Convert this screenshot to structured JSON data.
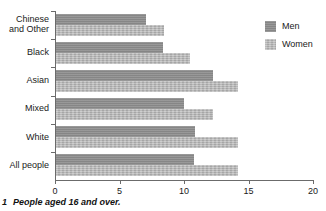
{
  "chart_data": {
    "type": "bar",
    "orientation": "horizontal",
    "title": "",
    "xlabel": "",
    "ylabel": "",
    "xlim": [
      0,
      20
    ],
    "xticks": [
      0,
      5,
      10,
      15,
      20
    ],
    "xtick_labels": [
      "0",
      "5",
      "10",
      "15",
      "20"
    ],
    "grid": false,
    "legend_position": "top-right",
    "categories": [
      "Chinese\nand Other",
      "Black",
      "Asian",
      "Mixed",
      "White",
      "All people"
    ],
    "series": [
      {
        "name": "Men",
        "color": "#8d8d8d",
        "values": [
          7.0,
          8.3,
          12.2,
          9.9,
          10.8,
          10.7
        ]
      },
      {
        "name": "Women",
        "color": "#b2b2b2",
        "values": [
          8.4,
          10.4,
          14.1,
          12.2,
          14.1,
          14.1
        ]
      }
    ]
  },
  "legend": {
    "items": [
      {
        "label": "Men",
        "color": "#8d8d8d"
      },
      {
        "label": "Women",
        "color": "#b2b2b2"
      }
    ]
  },
  "footnote": {
    "number": "1",
    "text": "People aged 16 and over."
  }
}
